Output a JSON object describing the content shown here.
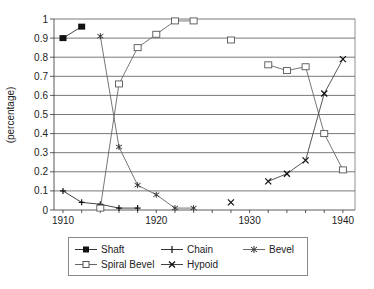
{
  "chart_data": {
    "type": "line",
    "title": "",
    "xlabel": "",
    "ylabel": "(percentage)",
    "xlim": [
      1909,
      1941
    ],
    "ylim": [
      0,
      1
    ],
    "xticks": [
      1910,
      1920,
      1930,
      1940
    ],
    "xtick_labels": [
      "1910",
      "1920",
      "1930",
      "1940"
    ],
    "yticks": [
      0,
      0.1,
      0.2,
      0.3,
      0.4,
      0.5,
      0.6,
      0.7,
      0.8,
      0.9,
      1
    ],
    "ytick_labels": [
      "0",
      "0.1",
      "0.2",
      "0.3",
      "0.4",
      "0.5",
      "0.6",
      "0.7",
      "0.8",
      "0.9",
      "1"
    ],
    "grid": "horizontal",
    "legend_position": "bottom",
    "series": [
      {
        "name": "Shaft",
        "marker": "filled-square",
        "points": [
          [
            1910,
            0.9
          ],
          [
            1912,
            0.96
          ]
        ]
      },
      {
        "name": "Chain",
        "marker": "plus",
        "points": [
          [
            1910,
            0.1
          ],
          [
            1912,
            0.04
          ],
          [
            1914,
            0.03
          ],
          [
            1916,
            0.01
          ],
          [
            1918,
            0.01
          ]
        ]
      },
      {
        "name": "Bevel",
        "marker": "asterisk",
        "points": [
          [
            1914,
            0.91
          ],
          [
            1916,
            0.33
          ],
          [
            1918,
            0.13
          ],
          [
            1920,
            0.08
          ],
          [
            1922,
            0.01
          ],
          [
            1924,
            0.01
          ]
        ]
      },
      {
        "name": "Spiral Bevel",
        "marker": "open-square",
        "points": [
          [
            1914,
            0.01
          ],
          [
            1916,
            0.66
          ],
          [
            1918,
            0.85
          ],
          [
            1920,
            0.92
          ],
          [
            1922,
            0.99
          ],
          [
            1924,
            0.99
          ],
          [
            1928,
            0.89,
            "break"
          ],
          [
            1932,
            0.76,
            "break"
          ],
          [
            1934,
            0.73
          ],
          [
            1936,
            0.75
          ],
          [
            1938,
            0.4
          ],
          [
            1940,
            0.21
          ]
        ]
      },
      {
        "name": "Hypoid",
        "marker": "x",
        "points": [
          [
            1928,
            0.04
          ],
          [
            1932,
            0.15,
            "break"
          ],
          [
            1934,
            0.19
          ],
          [
            1936,
            0.26
          ],
          [
            1938,
            0.61
          ],
          [
            1940,
            0.79
          ]
        ]
      }
    ]
  },
  "legend": {
    "items": [
      "Shaft",
      "Chain",
      "Bevel",
      "Spiral Bevel",
      "Hypoid"
    ]
  }
}
